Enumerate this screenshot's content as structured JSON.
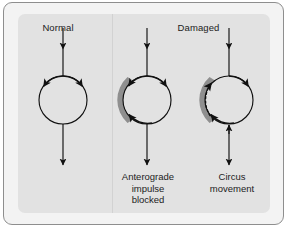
{
  "figure": {
    "type": "medical-diagram",
    "colors": {
      "page_background": "#ffffff",
      "frame_border": "#8e8e8e",
      "frame_fill": "#f3f3f3",
      "panel_fill": "#e2e2e2",
      "divider": "#d2d2d2",
      "stroke": "#111111",
      "block_fill": "#8f8f8f",
      "text": "#1c1c1c"
    }
  },
  "headers": {
    "normal": "Normal",
    "damaged": "Damaged"
  },
  "captions": {
    "blocked": "Anterograde\nimpulse\nblocked",
    "circus": "Circus\nmovement"
  },
  "panels": [
    {
      "id": "normal",
      "header": "Normal",
      "caption": "",
      "has_block": false,
      "has_dotted_retrograde": false,
      "inflow_arrow": "down",
      "outflow_arrow": "down",
      "limb_arrows": [
        "left-branch-down",
        "right-branch-down"
      ]
    },
    {
      "id": "blocked",
      "header": "Damaged",
      "caption": "Anterograde impulse blocked",
      "has_block": true,
      "has_dotted_retrograde": false,
      "inflow_arrow": "down",
      "outflow_arrow": "down",
      "limb_arrows": [
        "left-branch-down-into-block",
        "right-branch-around-up-to-block"
      ]
    },
    {
      "id": "circus",
      "header": "Damaged",
      "caption": "Circus movement",
      "has_block": true,
      "has_dotted_retrograde": true,
      "inflow_arrow": "down",
      "outflow_arrow": "bidirectional",
      "limb_arrows": [
        "left-branch-retrograde-up",
        "right-branch-down"
      ]
    }
  ]
}
